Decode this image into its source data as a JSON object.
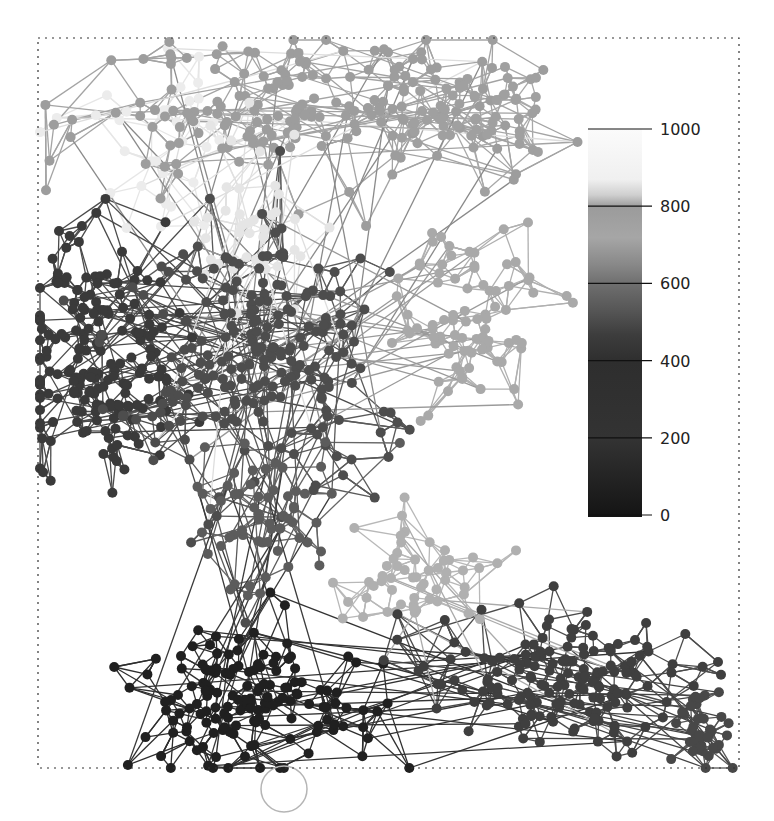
{
  "figure": {
    "width": 774,
    "height": 821,
    "frame": {
      "x": 38,
      "y": 38,
      "w": 701,
      "h": 730,
      "stroke": "#333333",
      "dash": "2,5"
    },
    "node_radius": 5,
    "edge_width": 1.3,
    "seed": 20240611
  },
  "colorbar": {
    "x": 588,
    "y": 129,
    "w": 54,
    "h": 388,
    "tick_line_x1": 588,
    "tick_line_x2": 652,
    "label_x": 660,
    "value_min": 0,
    "value_max": 1000,
    "color_min": "#111111",
    "color_max": "#ffffff",
    "stops": [
      {
        "v": 0,
        "c": "#141414"
      },
      {
        "v": 200,
        "c": "#333333"
      },
      {
        "v": 400,
        "c": "#2e2e2e"
      },
      {
        "v": 470,
        "c": "#3d3d3d"
      },
      {
        "v": 530,
        "c": "#555555"
      },
      {
        "v": 600,
        "c": "#6e6e6e"
      },
      {
        "v": 650,
        "c": "#888888"
      },
      {
        "v": 720,
        "c": "#a6a6a6"
      },
      {
        "v": 800,
        "c": "#9b9b9b"
      },
      {
        "v": 830,
        "c": "#cfcfcf"
      },
      {
        "v": 870,
        "c": "#f0f0f0"
      },
      {
        "v": 1000,
        "c": "#fbfbfb"
      }
    ],
    "ticks": [
      {
        "value": 1000,
        "label": "1000"
      },
      {
        "value": 800,
        "label": "800"
      },
      {
        "value": 600,
        "label": "600"
      },
      {
        "value": 400,
        "label": "400"
      },
      {
        "value": 200,
        "label": "200"
      },
      {
        "value": 0,
        "label": "0"
      }
    ]
  },
  "self_loop": {
    "cx": 284,
    "cy": 789,
    "r": 23,
    "stroke": "#b5b5b5"
  },
  "clusters": [
    {
      "name": "top-faint-left",
      "cx": 150,
      "cy": 150,
      "sx": 70,
      "sy": 70,
      "n": 35,
      "color": "#ececec",
      "edge": "#e6e6e6",
      "k": 2
    },
    {
      "name": "top-gray",
      "cx": 300,
      "cy": 110,
      "sx": 140,
      "sy": 55,
      "n": 170,
      "color": "#9d9d9d",
      "edge": "#a4a4a4",
      "k": 3
    },
    {
      "name": "top-gray-right",
      "cx": 470,
      "cy": 115,
      "sx": 55,
      "sy": 35,
      "n": 55,
      "color": "#a0a0a0",
      "edge": "#a8a8a8",
      "k": 3
    },
    {
      "name": "faint-middle",
      "cx": 260,
      "cy": 220,
      "sx": 50,
      "sy": 60,
      "n": 40,
      "color": "#e5e5e5",
      "edge": "#e0e0e0",
      "k": 2
    },
    {
      "name": "right-light",
      "cx": 470,
      "cy": 320,
      "sx": 50,
      "sy": 55,
      "n": 85,
      "color": "#a9a9a9",
      "edge": "#b0b0b0",
      "k": 3
    },
    {
      "name": "left-dark",
      "cx": 95,
      "cy": 360,
      "sx": 55,
      "sy": 80,
      "n": 190,
      "color": "#3a3a3a",
      "edge": "#4a4a4a",
      "k": 3
    },
    {
      "name": "middle-dark-gray",
      "cx": 260,
      "cy": 360,
      "sx": 80,
      "sy": 90,
      "n": 220,
      "color": "#4d4d4d",
      "edge": "#5a5a5a",
      "k": 3
    },
    {
      "name": "center-gray",
      "cx": 260,
      "cy": 520,
      "sx": 50,
      "sy": 45,
      "n": 60,
      "color": "#5c5c5c",
      "edge": "#666666",
      "k": 2
    },
    {
      "name": "light-lower-middle",
      "cx": 410,
      "cy": 570,
      "sx": 55,
      "sy": 35,
      "n": 55,
      "color": "#b0b0b0",
      "edge": "#b8b8b8",
      "k": 3
    },
    {
      "name": "bottom-black",
      "cx": 245,
      "cy": 700,
      "sx": 75,
      "sy": 50,
      "n": 150,
      "color": "#202020",
      "edge": "#2e2e2e",
      "k": 3
    },
    {
      "name": "bottom-right-dark",
      "cx": 560,
      "cy": 680,
      "sx": 95,
      "sy": 45,
      "n": 160,
      "color": "#3f3f3f",
      "edge": "#4c4c4c",
      "k": 3
    },
    {
      "name": "far-right-dense",
      "cx": 705,
      "cy": 730,
      "sx": 22,
      "sy": 25,
      "n": 40,
      "color": "#484848",
      "edge": "#555555",
      "k": 3
    }
  ],
  "bridges": [
    {
      "from": 1,
      "to": 6,
      "count": 18,
      "color": "#8a8a8a"
    },
    {
      "from": 5,
      "to": 6,
      "count": 40,
      "color": "#4a4a4a"
    },
    {
      "from": 6,
      "to": 4,
      "count": 20,
      "color": "#9a9a9a"
    },
    {
      "from": 6,
      "to": 7,
      "count": 20,
      "color": "#5a5a5a"
    },
    {
      "from": 7,
      "to": 9,
      "count": 12,
      "color": "#3a3a3a"
    },
    {
      "from": 9,
      "to": 10,
      "count": 22,
      "color": "#333333"
    },
    {
      "from": 10,
      "to": 11,
      "count": 20,
      "color": "#444444"
    },
    {
      "from": 8,
      "to": 10,
      "count": 8,
      "color": "#aaaaaa"
    },
    {
      "from": 0,
      "to": 1,
      "count": 10,
      "color": "#dddddd"
    },
    {
      "from": 3,
      "to": 6,
      "count": 10,
      "color": "#dedede"
    },
    {
      "from": 2,
      "to": 1,
      "count": 20,
      "color": "#a2a2a2"
    }
  ]
}
